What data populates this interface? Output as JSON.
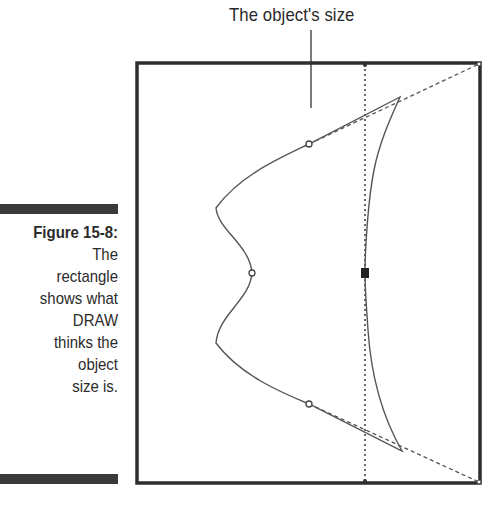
{
  "top_label": "The object's size",
  "caption": {
    "title": "Figure 15-8:",
    "lines": [
      "The",
      "rectangle",
      "shows what",
      "DRAW",
      "thinks the",
      "object",
      "size is."
    ]
  },
  "colors": {
    "rectangle": "#2e2e2e",
    "curve": "#555555",
    "dashed": "#555555",
    "caption_bar": "#3a3a3a",
    "text": "#2b2b2b"
  },
  "diagram": {
    "bounding_rectangle": {
      "x": 136,
      "y": 62,
      "width": 345,
      "height": 422
    },
    "center_guide_x": 365,
    "center_handle": {
      "x": 365,
      "y": 273
    },
    "nodes": [
      {
        "x": 309,
        "y": 144
      },
      {
        "x": 252,
        "y": 273
      },
      {
        "x": 309,
        "y": 404
      }
    ],
    "leader_line": {
      "x": 311,
      "y1": 30,
      "y2": 108
    }
  }
}
